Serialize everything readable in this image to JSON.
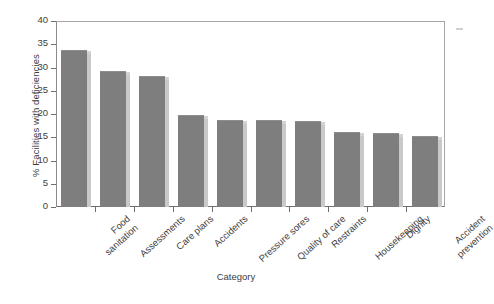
{
  "chart_data": {
    "type": "bar",
    "title": "",
    "xlabel": "Category",
    "ylabel": "% Facilities with deficiencies",
    "ylim": [
      0,
      40
    ],
    "ytick_values": [
      0,
      5,
      10,
      15,
      20,
      25,
      30,
      35,
      40
    ],
    "ytick_labels": [
      "0",
      "5",
      "10",
      "15",
      "20",
      "25",
      "30",
      "35",
      "40"
    ],
    "grid": false,
    "legend": null,
    "bar_color": "#7e7e7e",
    "bar_edge_highlight": "#c9c9c9",
    "categories": [
      "Food sanitation",
      "Assessments",
      "Care plans",
      "Accidents",
      "Pressure sores",
      "Quality of care",
      "Restraints",
      "Housekeeping",
      "Dignity",
      "Accident prevention"
    ],
    "category_lines": [
      [
        "Food",
        "sanitation"
      ],
      [
        "Assessments"
      ],
      [
        "Care plans"
      ],
      [
        "Accidents"
      ],
      [
        "Pressure sores"
      ],
      [
        "Quality of care"
      ],
      [
        "Restraints"
      ],
      [
        "Housekeeping"
      ],
      [
        "Dignity"
      ],
      [
        "Accident",
        "prevention"
      ]
    ],
    "values": [
      33.5,
      29,
      28,
      19.5,
      18.5,
      18.5,
      18.2,
      16,
      15.8,
      15
    ]
  }
}
